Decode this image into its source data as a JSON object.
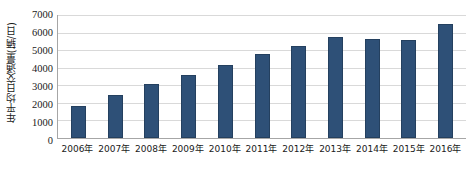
{
  "chart_data": {
    "type": "bar",
    "title": "",
    "xlabel": "",
    "ylabel": "年平均日交通量(辆/日)",
    "categories": [
      "2006年",
      "2007年",
      "2008年",
      "2009年",
      "2010年",
      "2011年",
      "2012年",
      "2013年",
      "2014年",
      "2015年",
      "2016年"
    ],
    "values": [
      1800,
      2450,
      3100,
      3600,
      4150,
      4800,
      5250,
      5750,
      5650,
      5600,
      6500
    ],
    "ylim": [
      0,
      7000
    ],
    "yticks": [
      0,
      1000,
      2000,
      3000,
      4000,
      5000,
      6000,
      7000
    ],
    "ytick_labels": [
      "0",
      "1000",
      "2000",
      "3000",
      "4000",
      "5000",
      "6000",
      "7000"
    ],
    "grid": true,
    "legend": false,
    "series": [
      {
        "name": "年平均日交通量",
        "color": "#2E5077",
        "values": [
          1800,
          2450,
          3100,
          3600,
          4150,
          4800,
          5250,
          5750,
          5650,
          5600,
          6500
        ]
      }
    ],
    "colors": {
      "bar": "#2E5077",
      "bar_border": "#24405F",
      "gridline": "#D9D9D9",
      "axis": "#A6A6A6",
      "background": "#FFFFFF",
      "text": "#1A1A1A"
    }
  }
}
